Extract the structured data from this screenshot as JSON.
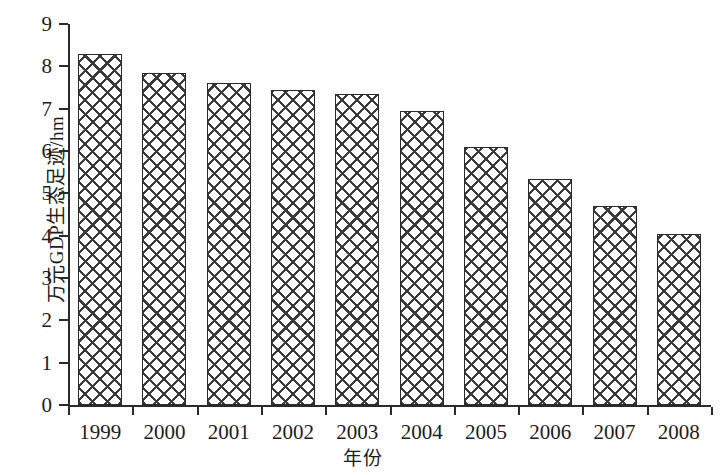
{
  "chart_data": {
    "type": "bar",
    "title": "",
    "xlabel": "年份",
    "ylabel": "万元GDP生态足迹/hm",
    "categories": [
      "1999",
      "2000",
      "2001",
      "2002",
      "2003",
      "2004",
      "2005",
      "2006",
      "2007",
      "2008"
    ],
    "values": [
      8.3,
      7.85,
      7.6,
      7.45,
      7.35,
      6.95,
      6.1,
      5.35,
      4.7,
      4.05
    ],
    "ylim": [
      0,
      9
    ],
    "yticks": [
      0,
      1,
      2,
      3,
      4,
      5,
      6,
      7,
      8,
      9
    ],
    "ytick_labels": [
      "0",
      "1",
      "2",
      "3",
      "4",
      "5",
      "6",
      "7",
      "8",
      "9"
    ],
    "grid": false,
    "legend": null,
    "series": [
      {
        "name": "万元GDP生态足迹",
        "values": [
          8.3,
          7.85,
          7.6,
          7.45,
          7.35,
          6.95,
          6.1,
          5.35,
          4.7,
          4.05
        ]
      }
    ],
    "bar_style": {
      "fill": "#ffffff",
      "pattern": "crosshatch",
      "pattern_color": "#3a3a3a",
      "edge_color": "#2b2b2b"
    },
    "axis_color": "#2a2a2a"
  }
}
